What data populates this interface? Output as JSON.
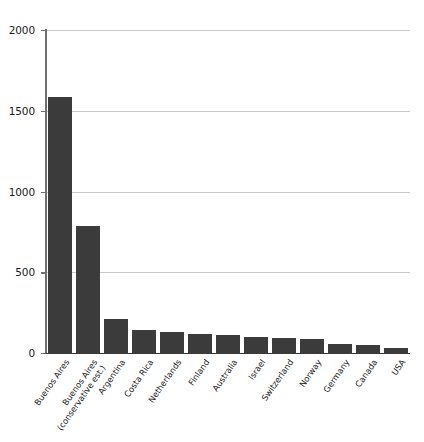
{
  "chart_data": {
    "type": "bar",
    "title": "",
    "subtitle": "",
    "xlabel": "",
    "ylabel": "",
    "ylim": [
      0,
      2000
    ],
    "grid": true,
    "legend": false,
    "orientation": "vertical",
    "bar_color": "#3b3b3b",
    "gridline_color": "#c9c9c9",
    "axis_color": "#3a3a3a",
    "y_ticks": [
      0,
      500,
      1000,
      1500,
      2000
    ],
    "y_tick_labels": [
      "0",
      "500",
      "1000",
      "1500",
      "2000"
    ],
    "categories": [
      "Buenos Aires",
      "Buenos Aires (conservative est.)",
      "Argentina",
      "Costa Rica",
      "Netherlands",
      "Finland",
      "Australia",
      "Israel",
      "Switzerland",
      "Norway",
      "Germany",
      "Canada",
      "USA"
    ],
    "category_lines": [
      [
        "Buenos Aires"
      ],
      [
        "Buenos Aires",
        "(conservative est.)"
      ],
      [
        "Argentina"
      ],
      [
        "Costa Rica"
      ],
      [
        "Netherlands"
      ],
      [
        "Finland"
      ],
      [
        "Australia"
      ],
      [
        "Israel"
      ],
      [
        "Switzerland"
      ],
      [
        "Norway"
      ],
      [
        "Germany"
      ],
      [
        "Canada"
      ],
      [
        "USA"
      ]
    ],
    "values": [
      1585,
      786,
      210,
      140,
      130,
      120,
      110,
      100,
      95,
      85,
      58,
      50,
      30
    ]
  }
}
